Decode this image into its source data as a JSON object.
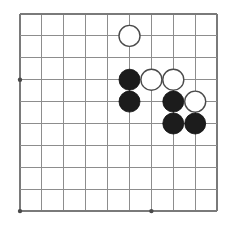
{
  "figure": {
    "kind": "go-board-diagram",
    "board_background_color": "#ffffff",
    "line_color": "#8d8d8d",
    "edge_line_color": "#7a7a7a",
    "black_stone_color": "#1c1c1c",
    "white_stone_color": "#ffffff",
    "white_stone_border_color": "#4a4a4a",
    "star_point_color": "#4a4a4a"
  },
  "grid": {
    "columns": 10,
    "rows": 10,
    "spacing_px": 21.9,
    "origin_x_px": 20,
    "origin_y_px": 14,
    "line_width_px": 1.1,
    "x_positions": [
      20,
      41.9,
      63.8,
      85.7,
      107.6,
      129.5,
      151.4,
      173.3,
      195.2,
      217.1
    ],
    "y_positions": [
      14,
      35.9,
      57.8,
      79.7,
      101.6,
      123.5,
      145.4,
      167.3,
      189.2,
      211.1
    ]
  },
  "star_points": [
    {
      "col": 1,
      "row": 4,
      "x": 20,
      "y": 79.7,
      "radius_px": 2.2
    },
    {
      "col": 1,
      "row": 10,
      "x": 20,
      "y": 211.1,
      "radius_px": 2.2
    },
    {
      "col": 7,
      "row": 10,
      "x": 151.4,
      "y": 211.1,
      "radius_px": 2.2
    }
  ],
  "stones": {
    "radius_px": 10.5,
    "count_total": 9,
    "count_black": 5,
    "count_white": 4,
    "items": [
      {
        "id": "w1",
        "color": "white",
        "col": 6,
        "row": 2,
        "x": 129.5,
        "y": 35.9
      },
      {
        "id": "b1",
        "color": "black",
        "col": 6,
        "row": 4,
        "x": 129.5,
        "y": 79.7
      },
      {
        "id": "w2",
        "color": "white",
        "col": 7,
        "row": 4,
        "x": 151.4,
        "y": 79.7
      },
      {
        "id": "w3",
        "color": "white",
        "col": 8,
        "row": 4,
        "x": 173.3,
        "y": 79.7
      },
      {
        "id": "b2",
        "color": "black",
        "col": 6,
        "row": 5,
        "x": 129.5,
        "y": 101.6
      },
      {
        "id": "b3",
        "color": "black",
        "col": 8,
        "row": 5,
        "x": 173.3,
        "y": 101.6
      },
      {
        "id": "w4",
        "color": "white",
        "col": 9,
        "row": 5,
        "x": 195.2,
        "y": 101.6
      },
      {
        "id": "b4",
        "color": "black",
        "col": 8,
        "row": 6,
        "x": 173.3,
        "y": 123.5
      },
      {
        "id": "b5",
        "color": "black",
        "col": 9,
        "row": 6,
        "x": 195.2,
        "y": 123.5
      }
    ]
  }
}
